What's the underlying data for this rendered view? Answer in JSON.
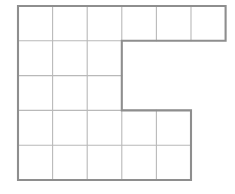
{
  "figure": {
    "title": "",
    "type": "grid-polyomino",
    "geometry": {
      "columns": 6,
      "rows": 5,
      "origin_x": 18,
      "origin_y": 6,
      "cell_width": 34.6,
      "cell_height": 34.8,
      "column_x": [
        18,
        52.6,
        87.2,
        121.8,
        156.4,
        191.0,
        225.6
      ],
      "row_y": [
        6,
        40.8,
        75.6,
        110.4,
        145.2,
        180.0
      ]
    },
    "colors": {
      "background": "#ffffff",
      "inner_grid_line": "#b9b9b9",
      "outline": "#8e8e8e",
      "cell_fill": "#ffffff"
    },
    "filled_cells": [
      [
        1,
        1
      ],
      [
        1,
        2
      ],
      [
        1,
        3
      ],
      [
        1,
        4
      ],
      [
        1,
        5
      ],
      [
        1,
        6
      ],
      [
        2,
        1
      ],
      [
        2,
        2
      ],
      [
        2,
        3
      ],
      [
        3,
        1
      ],
      [
        3,
        2
      ],
      [
        3,
        3
      ],
      [
        4,
        1
      ],
      [
        4,
        2
      ],
      [
        4,
        3
      ],
      [
        4,
        4
      ],
      [
        4,
        5
      ],
      [
        5,
        1
      ],
      [
        5,
        2
      ],
      [
        5,
        3
      ],
      [
        5,
        4
      ],
      [
        5,
        5
      ]
    ],
    "row_cell_counts": [
      6,
      3,
      3,
      5,
      5
    ],
    "total_cells": 22,
    "outline_vertices": [
      [
        18,
        6
      ],
      [
        225.6,
        6
      ],
      [
        225.6,
        40.8
      ],
      [
        121.8,
        40.8
      ],
      [
        121.8,
        110.4
      ],
      [
        191.0,
        110.4
      ],
      [
        191.0,
        180.0
      ],
      [
        18,
        180.0
      ]
    ]
  }
}
